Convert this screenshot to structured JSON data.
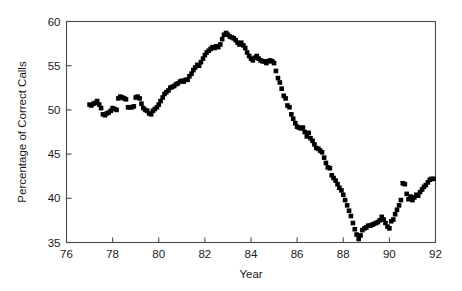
{
  "chart_data": {
    "type": "scatter",
    "title": "",
    "xlabel": "Year",
    "ylabel": "Percentage of Correct Calls",
    "xlim": [
      76,
      92
    ],
    "ylim": [
      35,
      60
    ],
    "xticks": [
      76,
      78,
      80,
      82,
      84,
      86,
      88,
      90,
      92
    ],
    "yticks": [
      35,
      40,
      45,
      50,
      55,
      60
    ],
    "grid": false,
    "legend": null,
    "marker": {
      "shape": "square",
      "color": "#000000",
      "size": 4.6
    },
    "series": [
      {
        "name": "Percentage of Correct Calls",
        "x": [
          77.0,
          77.08,
          77.17,
          77.25,
          77.33,
          77.42,
          77.5,
          77.58,
          77.67,
          77.75,
          77.83,
          77.92,
          78.0,
          78.08,
          78.17,
          78.25,
          78.33,
          78.42,
          78.5,
          78.58,
          78.67,
          78.75,
          78.83,
          78.92,
          79.0,
          79.08,
          79.17,
          79.25,
          79.33,
          79.42,
          79.5,
          79.58,
          79.67,
          79.75,
          79.83,
          79.92,
          80.0,
          80.08,
          80.17,
          80.25,
          80.33,
          80.42,
          80.5,
          80.58,
          80.67,
          80.75,
          80.83,
          80.92,
          81.0,
          81.08,
          81.17,
          81.25,
          81.33,
          81.42,
          81.5,
          81.58,
          81.67,
          81.75,
          81.83,
          81.92,
          82.0,
          82.08,
          82.17,
          82.25,
          82.33,
          82.42,
          82.5,
          82.58,
          82.67,
          82.75,
          82.83,
          82.92,
          83.0,
          83.08,
          83.17,
          83.25,
          83.33,
          83.42,
          83.5,
          83.58,
          83.67,
          83.75,
          83.83,
          83.92,
          84.0,
          84.08,
          84.17,
          84.25,
          84.33,
          84.42,
          84.5,
          84.58,
          84.67,
          84.75,
          84.83,
          84.92,
          85.0,
          85.08,
          85.17,
          85.25,
          85.33,
          85.42,
          85.5,
          85.58,
          85.67,
          85.75,
          85.83,
          85.92,
          86.0,
          86.08,
          86.17,
          86.25,
          86.33,
          86.42,
          86.5,
          86.58,
          86.67,
          86.75,
          86.83,
          86.92,
          87.0,
          87.08,
          87.17,
          87.25,
          87.33,
          87.42,
          87.5,
          87.58,
          87.67,
          87.75,
          87.83,
          87.92,
          88.0,
          88.08,
          88.17,
          88.25,
          88.33,
          88.42,
          88.5,
          88.58,
          88.67,
          88.75,
          88.83,
          88.92,
          89.0,
          89.08,
          89.17,
          89.25,
          89.33,
          89.42,
          89.5,
          89.58,
          89.67,
          89.75,
          89.83,
          89.92,
          90.0,
          90.08,
          90.17,
          90.25,
          90.33,
          90.42,
          90.5,
          90.58,
          90.67,
          90.75,
          90.83,
          90.92,
          91.0,
          91.08,
          91.17,
          91.25,
          91.33,
          91.42,
          91.5,
          91.58,
          91.67,
          91.75,
          91.83,
          91.92
        ],
        "y": [
          50.6,
          50.5,
          50.7,
          50.8,
          51.0,
          50.6,
          50.2,
          49.5,
          49.4,
          49.6,
          49.7,
          49.9,
          50.2,
          50.1,
          50.0,
          51.3,
          51.5,
          51.4,
          51.3,
          51.2,
          50.3,
          50.3,
          50.3,
          50.4,
          51.4,
          51.5,
          51.3,
          50.7,
          50.2,
          50.0,
          49.9,
          49.6,
          49.5,
          49.9,
          50.1,
          50.3,
          50.6,
          51.0,
          51.4,
          51.8,
          52.0,
          52.2,
          52.5,
          52.6,
          52.7,
          52.9,
          53.0,
          53.2,
          53.3,
          53.2,
          53.4,
          53.4,
          53.8,
          54.1,
          54.5,
          54.8,
          55.1,
          55.0,
          55.4,
          55.8,
          56.2,
          56.5,
          56.7,
          56.9,
          57.1,
          57.0,
          57.2,
          57.1,
          57.4,
          58.0,
          58.5,
          58.7,
          58.5,
          58.3,
          58.2,
          58.1,
          57.9,
          57.6,
          57.4,
          57.6,
          57.3,
          57.0,
          56.5,
          56.1,
          55.8,
          55.6,
          55.9,
          56.1,
          55.8,
          55.6,
          55.5,
          55.5,
          55.3,
          55.5,
          55.6,
          55.5,
          55.3,
          54.4,
          53.6,
          53.1,
          52.4,
          51.6,
          51.3,
          50.5,
          50.3,
          49.5,
          49.0,
          48.5,
          48.1,
          48.0,
          47.9,
          48.0,
          47.5,
          47.0,
          47.4,
          46.8,
          46.5,
          46.1,
          45.7,
          45.6,
          45.4,
          45.2,
          44.6,
          44.0,
          43.5,
          43.4,
          42.6,
          42.3,
          42.0,
          41.6,
          41.2,
          40.9,
          40.4,
          39.8,
          39.2,
          38.6,
          38.0,
          37.2,
          36.5,
          35.9,
          35.4,
          35.8,
          36.4,
          36.6,
          36.7,
          36.9,
          36.9,
          37.0,
          37.1,
          37.2,
          37.3,
          37.5,
          37.9,
          37.6,
          37.2,
          36.8,
          36.6,
          37.4,
          37.6,
          38.2,
          38.7,
          39.2,
          39.8,
          41.7,
          41.6,
          40.5,
          39.9,
          40.2,
          39.8,
          40.1,
          40.4,
          40.3,
          40.7,
          41.0,
          41.3,
          41.5,
          41.8,
          42.1,
          42.2,
          42.2
        ]
      }
    ]
  },
  "axes": {
    "y_title": "Percentage of Correct Calls",
    "x_title": "Year",
    "y_tick_labels": [
      "35",
      "40",
      "45",
      "50",
      "55",
      "60"
    ],
    "x_tick_labels": [
      "76",
      "78",
      "80",
      "82",
      "84",
      "86",
      "88",
      "90",
      "92"
    ]
  }
}
